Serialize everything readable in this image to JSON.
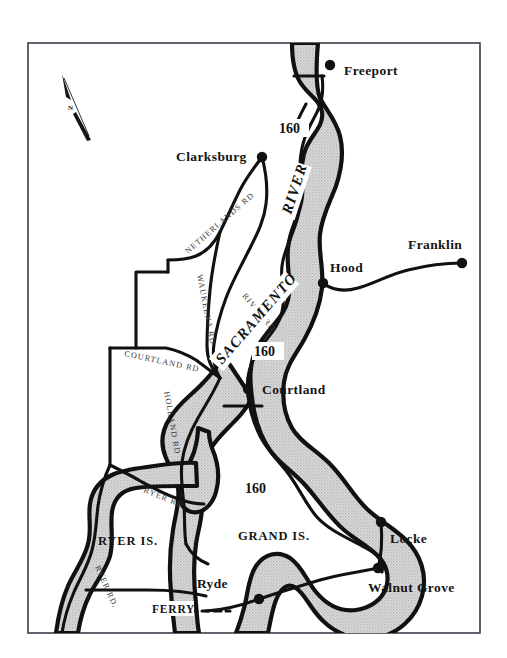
{
  "map": {
    "title": "Sacramento River Delta Map",
    "frame": {
      "stroke": "#3c3c49",
      "fill": "#ffffff"
    },
    "colors": {
      "river_fill": "#d3d3d3",
      "river_outline": "#111111",
      "road": "#111111",
      "land": "#ffffff",
      "text": "#151515",
      "road_label": "#3a3a3a"
    },
    "compass": {
      "label": "N",
      "name": "north-arrow"
    },
    "river": {
      "name_part_1": "SACRAMENTO",
      "name_part_2": "RIVER"
    },
    "cities": [
      {
        "name": "Freeport",
        "label": "Freeport",
        "x": 330,
        "y": 65,
        "label_x": 344,
        "label_y": 75
      },
      {
        "name": "Clarksburg",
        "label": "Clarksburg",
        "x": 262,
        "y": 157,
        "label_x": 176,
        "label_y": 160
      },
      {
        "name": "Franklin",
        "label": "Franklin",
        "x": 462,
        "y": 263,
        "label_x": 408,
        "label_y": 249
      },
      {
        "name": "Hood",
        "label": "Hood",
        "x": 323,
        "y": 283,
        "label_x": 330,
        "label_y": 272
      },
      {
        "name": "Courtland",
        "label": "Courtland",
        "x": 248,
        "y": 389,
        "label_x": 262,
        "label_y": 394
      },
      {
        "name": "Locke",
        "label": "Locke",
        "x": 381,
        "y": 522,
        "label_x": 390,
        "label_y": 543
      },
      {
        "name": "Walnut Grove",
        "label": "Walnut Grove",
        "x": 378,
        "y": 568,
        "label_x": 368,
        "label_y": 592
      },
      {
        "name": "Ryde",
        "label": "Ryde",
        "x": 259,
        "y": 599,
        "label_x": 228,
        "label_y": 588
      }
    ],
    "islands": [
      {
        "name": "Ryer Island",
        "label": "RYER IS.",
        "x": 128,
        "y": 545
      },
      {
        "name": "Grand Island",
        "label": "GRAND IS.",
        "x": 244,
        "y": 540
      }
    ],
    "highway_shields": [
      {
        "label": "160",
        "x": 282,
        "y": 131
      },
      {
        "label": "160",
        "x": 257,
        "y": 354
      },
      {
        "label": "160",
        "x": 248,
        "y": 491
      }
    ],
    "roads": [
      {
        "label": "NETHERLANDS RD",
        "name": "netherlands-rd"
      },
      {
        "label": "WAUKEENA RD",
        "name": "waukeena-rd"
      },
      {
        "label": "RIVER RD",
        "name": "river-rd-north"
      },
      {
        "label": "COURTLAND RD",
        "name": "courtland-rd"
      },
      {
        "label": "HOLLAND RD",
        "name": "holland-rd"
      },
      {
        "label": "RYER RD.",
        "name": "ryer-rd-upper"
      },
      {
        "label": "RYER RD.",
        "name": "ryer-rd-lower"
      }
    ],
    "ferry": {
      "label": "FERRY",
      "x": 156,
      "y": 611
    }
  }
}
